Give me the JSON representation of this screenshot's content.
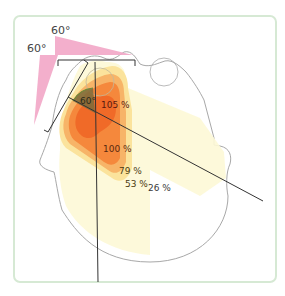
{
  "figure": {
    "type": "radiotherapy dose distribution (isodose) on axial CT outline",
    "wedge_labels": [
      "60°",
      "60°"
    ],
    "angle_label": "60°",
    "isodose_labels": [
      {
        "value": "105 %",
        "level": 105
      },
      {
        "value": "100 %",
        "level": 100
      },
      {
        "value": "79 %",
        "level": 79
      },
      {
        "value": "53 %",
        "level": 53
      },
      {
        "value": "26 %",
        "level": 26
      }
    ],
    "colors": {
      "frame": "#d8ead8",
      "wedge": "#f2a6c6",
      "iso105": "#f06a28",
      "iso100": "#f5883a",
      "iso79": "#f7b266",
      "iso53": "#fbe39a",
      "iso26": "#fdf8d8",
      "hinge": "#7a6a3a",
      "outline": "#9a9a9a",
      "beam": "#333333"
    }
  }
}
